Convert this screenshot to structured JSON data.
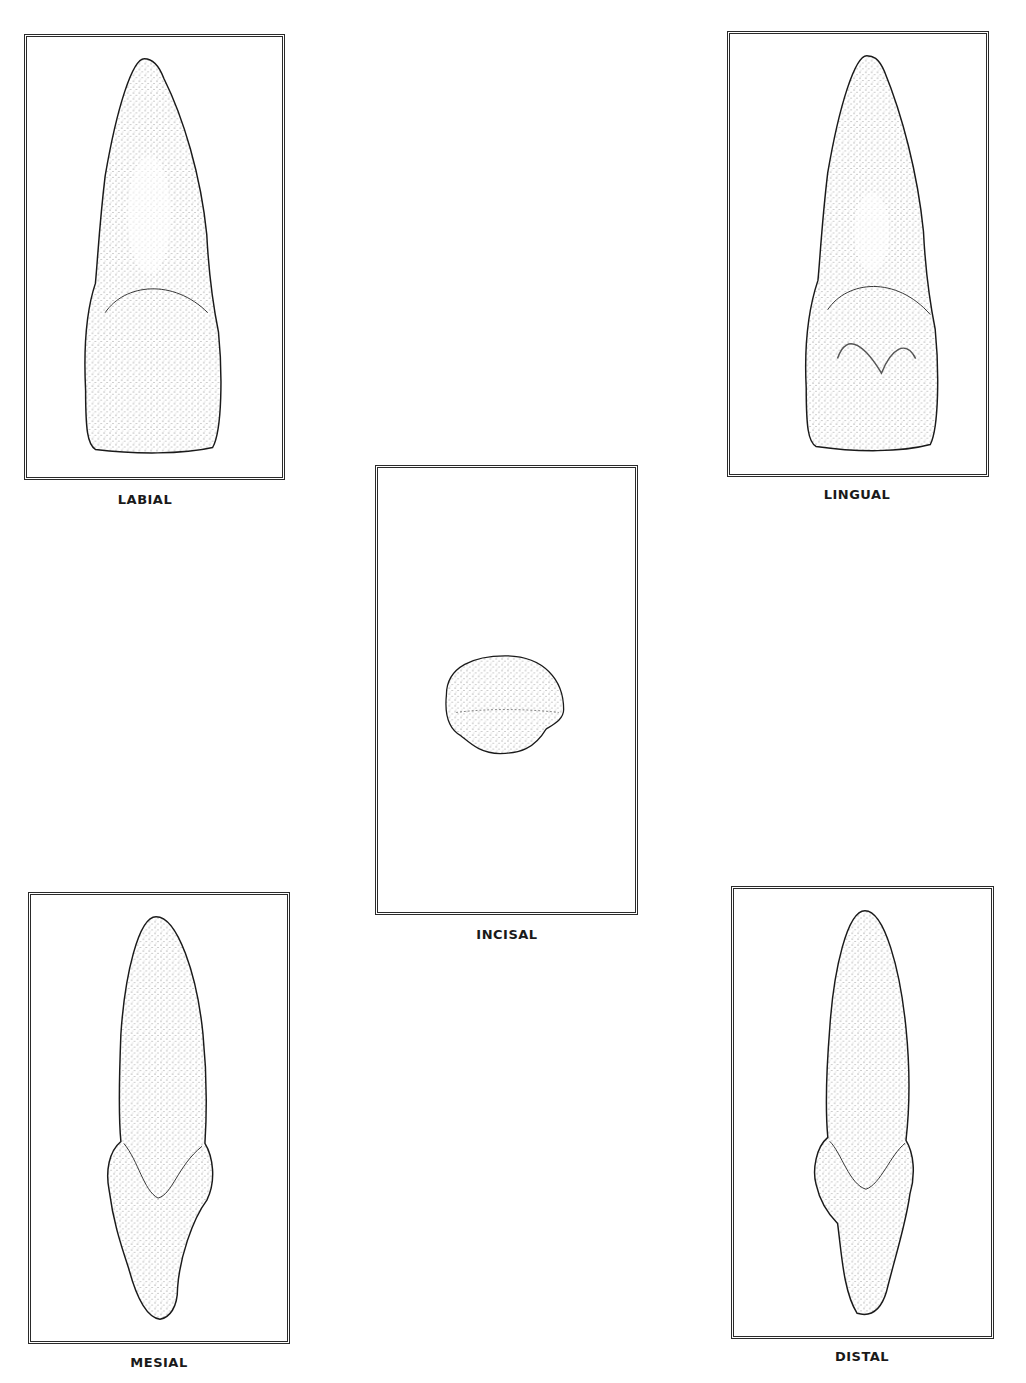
{
  "figure": {
    "panels": [
      {
        "id": "labial",
        "label": "LABIAL",
        "view": "labial-view"
      },
      {
        "id": "lingual",
        "label": "LINGUAL",
        "view": "lingual-view"
      },
      {
        "id": "incisal",
        "label": "INCISAL",
        "view": "incisal-view"
      },
      {
        "id": "mesial",
        "label": "MESIAL",
        "view": "mesial-view"
      },
      {
        "id": "distal",
        "label": "DISTAL",
        "view": "distal-view"
      }
    ],
    "colors": {
      "frame": "#2a2a2a",
      "stipple": "#555555",
      "outline": "#1a1a1a",
      "background": "#ffffff"
    }
  }
}
